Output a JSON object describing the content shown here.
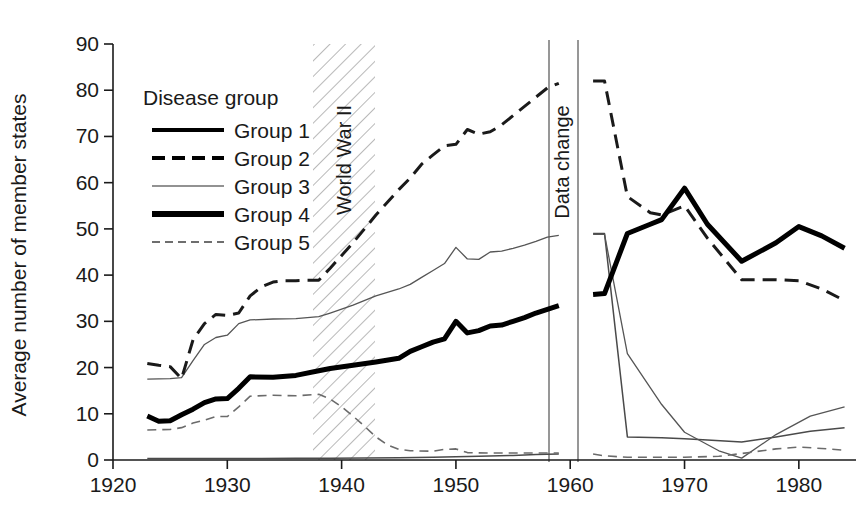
{
  "chart_data": {
    "type": "line",
    "title": "",
    "xlabel": "",
    "ylabel": "Average number of member states",
    "xlim": [
      1920,
      1985
    ],
    "ylim": [
      0,
      90
    ],
    "xticks": [
      1920,
      1930,
      1940,
      1950,
      1960,
      1970,
      1980
    ],
    "yticks": [
      0,
      10,
      20,
      30,
      40,
      50,
      60,
      70,
      80,
      90
    ],
    "grid": false,
    "legend_position": "upper-left-inside",
    "legend_title": "Disease group",
    "annotations": [
      {
        "name": "world-war-ii-band",
        "label": "World War II",
        "x_start": 1939,
        "x_end": 1945,
        "style": "diagonal-hatch"
      },
      {
        "name": "data-change-gap",
        "label": "Data change",
        "x_start": 1959.5,
        "x_end": 1962,
        "style": "blank-gap-with-rules"
      }
    ],
    "series": [
      {
        "name": "Group 1",
        "style": "solid-thin",
        "color": "#4a4a4a",
        "width": 1.5,
        "dash": "none",
        "segments": [
          {
            "name": "pre-data-change",
            "points": [
              [
                1923,
                0.3
              ],
              [
                1925,
                0.3
              ],
              [
                1927,
                0.3
              ],
              [
                1930,
                0.35
              ],
              [
                1933,
                0.35
              ],
              [
                1936,
                0.4
              ],
              [
                1939,
                0.4
              ],
              [
                1942,
                0.45
              ],
              [
                1945,
                0.5
              ],
              [
                1948,
                0.6
              ],
              [
                1950,
                0.7
              ],
              [
                1952,
                0.8
              ],
              [
                1955,
                1.0
              ],
              [
                1957,
                1.2
              ],
              [
                1959,
                1.3
              ]
            ]
          },
          {
            "name": "post-data-change",
            "points": [
              [
                1962,
                49.0
              ],
              [
                1963,
                49.0
              ],
              [
                1965,
                5.0
              ],
              [
                1968,
                4.8
              ],
              [
                1970,
                4.6
              ],
              [
                1972,
                4.3
              ],
              [
                1975,
                3.9
              ],
              [
                1978,
                5.0
              ],
              [
                1981,
                6.2
              ],
              [
                1984,
                7.0
              ]
            ]
          }
        ]
      },
      {
        "name": "Group 2",
        "style": "dashed-bold",
        "color": "#1a1a1a",
        "width": 3.0,
        "dash": "14,8",
        "segments": [
          {
            "name": "pre-data-change",
            "points": [
              [
                1923,
                20.9
              ],
              [
                1924,
                20.5
              ],
              [
                1925,
                20.2
              ],
              [
                1926,
                17.6
              ],
              [
                1927,
                26.0
              ],
              [
                1928,
                29.5
              ],
              [
                1929,
                31.5
              ],
              [
                1930,
                31.3
              ],
              [
                1931,
                31.8
              ],
              [
                1932,
                35.5
              ],
              [
                1933,
                37.5
              ],
              [
                1934,
                38.5
              ],
              [
                1935,
                38.8
              ],
              [
                1936,
                38.8
              ],
              [
                1937,
                38.9
              ],
              [
                1938,
                38.9
              ],
              [
                1939,
                41.5
              ],
              [
                1941,
                47.0
              ],
              [
                1943,
                53.0
              ],
              [
                1945,
                58.5
              ],
              [
                1946,
                61.0
              ],
              [
                1947,
                64.0
              ],
              [
                1948,
                66.0
              ],
              [
                1949,
                68.0
              ],
              [
                1950,
                68.3
              ],
              [
                1951,
                71.5
              ],
              [
                1952,
                70.5
              ],
              [
                1953,
                71.0
              ],
              [
                1954,
                72.5
              ],
              [
                1955,
                74.5
              ],
              [
                1956,
                76.5
              ],
              [
                1957,
                78.5
              ],
              [
                1958,
                80.5
              ],
              [
                1959,
                81.5
              ]
            ]
          },
          {
            "name": "post-data-change",
            "points": [
              [
                1962,
                82.0
              ],
              [
                1963,
                82.0
              ],
              [
                1965,
                57.0
              ],
              [
                1967,
                53.5
              ],
              [
                1968,
                53.0
              ],
              [
                1970,
                55.0
              ],
              [
                1972,
                48.0
              ],
              [
                1975,
                39.0
              ],
              [
                1978,
                39.0
              ],
              [
                1980,
                38.8
              ],
              [
                1982,
                37.0
              ],
              [
                1984,
                34.5
              ]
            ]
          }
        ]
      },
      {
        "name": "Group 3",
        "style": "solid-thin-gray",
        "color": "#555555",
        "width": 1.3,
        "dash": "none",
        "segments": [
          {
            "name": "pre-data-change",
            "points": [
              [
                1923,
                17.5
              ],
              [
                1925,
                17.6
              ],
              [
                1926,
                17.8
              ],
              [
                1927,
                21.5
              ],
              [
                1928,
                25.0
              ],
              [
                1929,
                26.5
              ],
              [
                1930,
                27.0
              ],
              [
                1931,
                29.5
              ],
              [
                1932,
                30.3
              ],
              [
                1934,
                30.5
              ],
              [
                1936,
                30.6
              ],
              [
                1938,
                31.0
              ],
              [
                1939,
                31.8
              ],
              [
                1941,
                33.5
              ],
              [
                1943,
                35.5
              ],
              [
                1945,
                37.0
              ],
              [
                1946,
                38.0
              ],
              [
                1947,
                39.5
              ],
              [
                1948,
                41.0
              ],
              [
                1949,
                42.5
              ],
              [
                1950,
                46.0
              ],
              [
                1951,
                43.5
              ],
              [
                1952,
                43.4
              ],
              [
                1953,
                45.0
              ],
              [
                1954,
                45.2
              ],
              [
                1955,
                45.8
              ],
              [
                1956,
                46.5
              ],
              [
                1957,
                47.3
              ],
              [
                1958,
                48.2
              ],
              [
                1959,
                48.6
              ]
            ]
          },
          {
            "name": "post-data-change",
            "points": [
              [
                1962,
                48.8
              ],
              [
                1963,
                48.8
              ],
              [
                1965,
                23.0
              ],
              [
                1968,
                12.0
              ],
              [
                1970,
                6.0
              ],
              [
                1973,
                2.0
              ],
              [
                1975,
                0.4
              ],
              [
                1978,
                5.5
              ],
              [
                1981,
                9.5
              ],
              [
                1984,
                11.5
              ]
            ]
          }
        ]
      },
      {
        "name": "Group 4",
        "style": "solid-bold",
        "color": "#000000",
        "width": 5.0,
        "dash": "none",
        "segments": [
          {
            "name": "pre-data-change",
            "points": [
              [
                1923,
                9.5
              ],
              [
                1924,
                8.4
              ],
              [
                1925,
                8.5
              ],
              [
                1926,
                9.8
              ],
              [
                1927,
                11.0
              ],
              [
                1928,
                12.4
              ],
              [
                1929,
                13.2
              ],
              [
                1930,
                13.3
              ],
              [
                1931,
                15.5
              ],
              [
                1932,
                18.0
              ],
              [
                1934,
                17.9
              ],
              [
                1936,
                18.3
              ],
              [
                1938,
                19.3
              ],
              [
                1939,
                19.8
              ],
              [
                1941,
                20.5
              ],
              [
                1943,
                21.2
              ],
              [
                1945,
                22.0
              ],
              [
                1946,
                23.5
              ],
              [
                1947,
                24.5
              ],
              [
                1948,
                25.5
              ],
              [
                1949,
                26.2
              ],
              [
                1950,
                30.0
              ],
              [
                1951,
                27.5
              ],
              [
                1952,
                28.0
              ],
              [
                1953,
                29.0
              ],
              [
                1954,
                29.2
              ],
              [
                1955,
                30.0
              ],
              [
                1956,
                30.8
              ],
              [
                1957,
                31.8
              ],
              [
                1958,
                32.6
              ],
              [
                1959,
                33.4
              ]
            ]
          },
          {
            "name": "post-data-change",
            "points": [
              [
                1962,
                35.8
              ],
              [
                1963,
                36.0
              ],
              [
                1965,
                49.0
              ],
              [
                1967,
                51.0
              ],
              [
                1968,
                52.0
              ],
              [
                1970,
                58.8
              ],
              [
                1972,
                51.0
              ],
              [
                1975,
                43.0
              ],
              [
                1978,
                47.0
              ],
              [
                1980,
                50.5
              ],
              [
                1982,
                48.5
              ],
              [
                1984,
                45.8
              ]
            ]
          }
        ]
      },
      {
        "name": "Group 5",
        "style": "dashed-thin",
        "color": "#6b6b6b",
        "width": 1.6,
        "dash": "9,6",
        "segments": [
          {
            "name": "pre-data-change",
            "points": [
              [
                1923,
                6.5
              ],
              [
                1925,
                6.6
              ],
              [
                1926,
                7.0
              ],
              [
                1927,
                8.0
              ],
              [
                1928,
                8.6
              ],
              [
                1929,
                9.4
              ],
              [
                1930,
                9.4
              ],
              [
                1931,
                11.5
              ],
              [
                1932,
                13.8
              ],
              [
                1934,
                14.0
              ],
              [
                1936,
                13.9
              ],
              [
                1938,
                14.2
              ],
              [
                1939,
                13.2
              ],
              [
                1940,
                11.5
              ],
              [
                1941,
                9.5
              ],
              [
                1942,
                7.3
              ],
              [
                1943,
                5.0
              ],
              [
                1944,
                3.3
              ],
              [
                1945,
                2.3
              ],
              [
                1946,
                2.0
              ],
              [
                1948,
                1.9
              ],
              [
                1949,
                2.3
              ],
              [
                1950,
                2.4
              ],
              [
                1951,
                1.6
              ],
              [
                1953,
                1.5
              ],
              [
                1955,
                1.5
              ],
              [
                1957,
                1.5
              ],
              [
                1959,
                1.5
              ]
            ]
          },
          {
            "name": "post-data-change",
            "points": [
              [
                1962,
                1.3
              ],
              [
                1963,
                0.9
              ],
              [
                1965,
                0.6
              ],
              [
                1968,
                0.6
              ],
              [
                1970,
                0.6
              ],
              [
                1973,
                0.8
              ],
              [
                1975,
                1.4
              ],
              [
                1978,
                2.4
              ],
              [
                1980,
                2.8
              ],
              [
                1982,
                2.5
              ],
              [
                1984,
                2.1
              ]
            ]
          }
        ]
      }
    ],
    "legend_entries": [
      {
        "label": "Group 1",
        "style": "solid-bold-key"
      },
      {
        "label": "Group 2",
        "style": "dashed-bold-key"
      },
      {
        "label": "Group 3",
        "style": "solid-thin-key"
      },
      {
        "label": "Group 4",
        "style": "solid-extrabold-key"
      },
      {
        "label": "Group 5",
        "style": "dashed-thin-key"
      }
    ]
  }
}
